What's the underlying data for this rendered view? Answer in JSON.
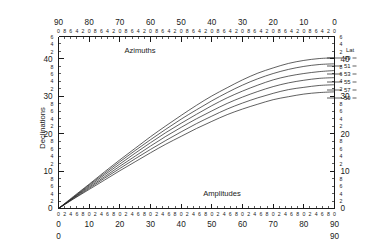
{
  "figure": {
    "axis_titles": {
      "top": "Azimuths",
      "bottom": "Amplitudes",
      "left": "Declinations",
      "legend": "Lat"
    }
  },
  "chart_data": {
    "type": "line",
    "title": "",
    "subtitle": "",
    "xlabel": "Amplitudes",
    "ylabel": "Declinations",
    "top_axis_label": "Azimuths",
    "legend_title": "Lat",
    "legend_position": "right-inside",
    "grid": false,
    "x_axis": {
      "name": "Amplitudes",
      "range": [
        0,
        90
      ],
      "direction": "left-to-right",
      "major_ticks": [
        0,
        10,
        20,
        30,
        40,
        50,
        60,
        70,
        80,
        90
      ],
      "major_tick_labels": [
        "0",
        "10",
        "20",
        "30",
        "40",
        "50",
        "60",
        "70",
        "80",
        "90"
      ],
      "minor_tick_step": 2,
      "minor_tick_labels_cycle": [
        "0",
        "2",
        "4",
        "6",
        "8"
      ]
    },
    "top_axis": {
      "name": "Azimuths",
      "range": [
        90,
        0
      ],
      "direction": "right-to-left",
      "major_ticks": [
        90,
        80,
        70,
        60,
        50,
        40,
        30,
        20,
        10,
        0
      ],
      "major_tick_labels": [
        "90",
        "80",
        "70",
        "60",
        "50",
        "40",
        "30",
        "20",
        "10",
        "0"
      ],
      "minor_tick_step": 2,
      "minor_tick_labels_cycle": [
        "0",
        "8",
        "6",
        "4",
        "2"
      ]
    },
    "y_axis": {
      "name": "Declinations",
      "range": [
        0,
        46
      ],
      "direction": "bottom-to-top",
      "major_ticks": [
        0,
        10,
        20,
        30,
        40
      ],
      "major_tick_labels": [
        "0",
        "10",
        "20",
        "30",
        "40"
      ],
      "minor_tick_step": 2,
      "minor_tick_labels_cycle": [
        "2",
        "4",
        "6",
        "8"
      ],
      "top_minor_labels": [
        "2",
        "4",
        "6"
      ]
    },
    "y_axis_right": {
      "name": "Declinations",
      "range": [
        0,
        46
      ],
      "major_ticks": [
        0,
        10,
        20,
        30,
        40
      ],
      "major_tick_labels": [
        "0",
        "10",
        "20",
        "30",
        "40"
      ],
      "minor_tick_step": 2
    },
    "relation": "sin(declination) = sin(amplitude) * cos(latitude)",
    "categories": [
      0,
      5,
      10,
      15,
      20,
      25,
      30,
      35,
      40,
      45,
      50,
      55,
      60,
      65,
      70,
      75,
      80,
      85,
      90
    ],
    "series": [
      {
        "name": "49",
        "label": "49",
        "latitude": 49,
        "values": [
          0.0,
          3.3,
          6.5,
          9.8,
          13.0,
          16.1,
          19.2,
          22.1,
          24.9,
          27.6,
          30.1,
          32.3,
          34.4,
          36.2,
          37.6,
          38.8,
          39.6,
          40.1,
          40.3
        ]
      },
      {
        "name": "51",
        "label": "51",
        "latitude": 51,
        "values": [
          0.0,
          3.1,
          6.3,
          9.4,
          12.5,
          15.5,
          18.4,
          21.2,
          23.9,
          26.4,
          28.8,
          31.0,
          33.0,
          34.7,
          36.1,
          37.2,
          38.0,
          38.5,
          38.7
        ]
      },
      {
        "name": "53",
        "label": "53",
        "latitude": 53,
        "values": [
          0.0,
          3.0,
          6.0,
          9.0,
          11.9,
          14.8,
          17.6,
          20.3,
          22.8,
          25.2,
          27.5,
          29.6,
          31.4,
          33.0,
          34.4,
          35.4,
          36.1,
          36.6,
          36.9
        ]
      },
      {
        "name": "55",
        "label": "55",
        "latitude": 55,
        "values": [
          0.0,
          2.9,
          5.7,
          8.5,
          11.3,
          14.0,
          16.7,
          19.3,
          21.7,
          24.0,
          26.1,
          28.1,
          29.8,
          31.3,
          32.6,
          33.6,
          34.3,
          34.8,
          35.0
        ]
      },
      {
        "name": "57",
        "label": "57",
        "latitude": 57,
        "values": [
          0.0,
          2.7,
          5.4,
          8.1,
          10.7,
          13.3,
          15.8,
          18.2,
          20.5,
          22.7,
          24.7,
          26.6,
          28.2,
          29.6,
          30.8,
          31.8,
          32.4,
          32.9,
          33.1
        ]
      },
      {
        "name": "59",
        "label": "59",
        "latitude": 59,
        "values": [
          0.0,
          2.6,
          5.1,
          7.6,
          10.1,
          12.5,
          14.9,
          17.2,
          19.3,
          21.4,
          23.3,
          25.1,
          26.6,
          27.9,
          29.1,
          29.9,
          30.6,
          31.0,
          31.2
        ]
      }
    ]
  }
}
